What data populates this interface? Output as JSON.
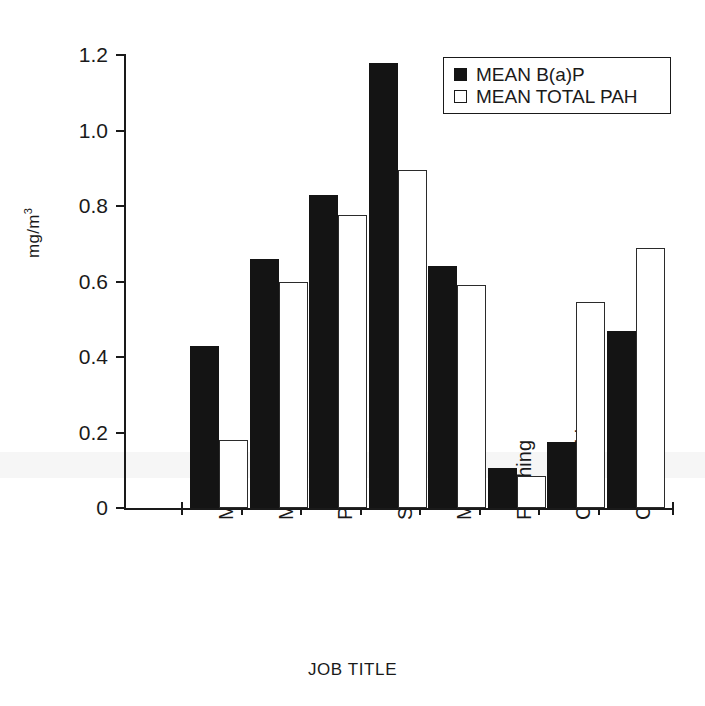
{
  "chart_data": {
    "type": "bar",
    "title": "",
    "xlabel": "JOB TITLE",
    "ylabel": "mg/m3",
    "ylabel_display": "mg/m",
    "ylabel_sup": "3",
    "categories": [
      "Mixer",
      "Molder",
      "Pourer",
      "Shake-out",
      "Meltman",
      "Finishing",
      "Core Making",
      "Craneman"
    ],
    "series": [
      {
        "name": "MEAN B(a)P",
        "color": "#141414",
        "fill": "solid",
        "values": [
          0.43,
          0.66,
          0.83,
          1.18,
          0.64,
          0.105,
          0.175,
          0.47
        ]
      },
      {
        "name": "MEAN TOTAL PAH",
        "color": "#ffffff",
        "fill": "hollow",
        "values": [
          0.18,
          0.6,
          0.775,
          0.895,
          0.59,
          0.085,
          0.545,
          0.69
        ]
      }
    ],
    "ylim": [
      0,
      1.2
    ],
    "yticks": [
      0,
      0.2,
      0.4,
      0.6,
      0.8,
      1.0,
      1.2
    ],
    "ytick_labels": [
      "0",
      "0.2",
      "0.4",
      "0.6",
      "0.8",
      "1.0",
      "1.2"
    ],
    "grid": false,
    "legend_position": "top-right"
  },
  "legend": {
    "entries": [
      {
        "label": "MEAN B(a)P"
      },
      {
        "label": "MEAN TOTAL PAH"
      }
    ]
  }
}
